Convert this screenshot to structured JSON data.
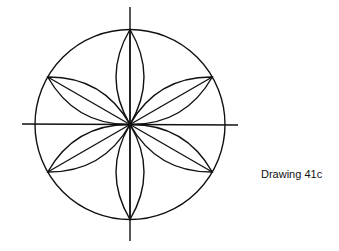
{
  "caption": "Drawing 41c",
  "figure": {
    "center": [
      130,
      124
    ],
    "radius": 95,
    "petal_count": 6,
    "stroke_color": "#111111"
  }
}
